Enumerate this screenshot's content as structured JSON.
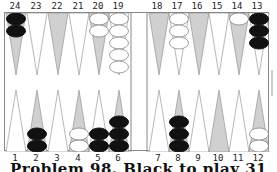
{
  "top_labels": [
    "24",
    "23",
    "22",
    "21",
    "20",
    "19",
    "18",
    "17",
    "16",
    "15",
    "14",
    "13"
  ],
  "bottom_labels": [
    "1",
    "2",
    "3",
    "4",
    "5",
    "6",
    "7",
    "8",
    "9",
    "10",
    "11",
    "12"
  ],
  "caption": "Problem 98. Black to play 31",
  "colors": {
    "black_checker": "#111111",
    "white_checker": "#ffffff",
    "shaded_point": "#d0d0d0",
    "border": "#888888"
  },
  "position": {
    "24": {
      "color": "black",
      "count": 2
    },
    "20": {
      "color": "white",
      "count": 2
    },
    "19": {
      "color": "white",
      "count": 5
    },
    "17": {
      "color": "white",
      "count": 3
    },
    "14": {
      "color": "white",
      "count": 1
    },
    "13": {
      "color": "black",
      "count": 3
    },
    "2": {
      "color": "black",
      "count": 2
    },
    "4": {
      "color": "white",
      "count": 2
    },
    "5": {
      "color": "black",
      "count": 2
    },
    "6": {
      "color": "black",
      "count": 3
    },
    "8": {
      "color": "black",
      "count": 3
    },
    "12": {
      "color": "white",
      "count": 2
    }
  }
}
